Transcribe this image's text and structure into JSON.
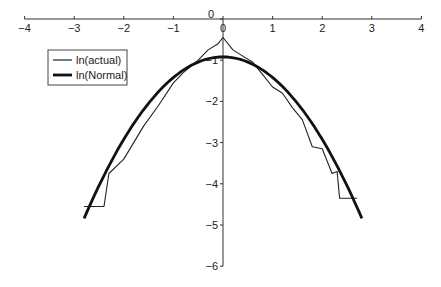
{
  "chart_data": {
    "type": "line",
    "title": "",
    "xlabel": "",
    "ylabel": "",
    "xlim": [
      -4,
      4
    ],
    "ylim": [
      -6,
      0
    ],
    "grid": false,
    "legend_position": "upper-left",
    "x_ticks": [
      -4,
      -3,
      -2,
      -1,
      0,
      1,
      2,
      3,
      4
    ],
    "x_tick_labels": [
      "−4",
      "−3",
      "−2",
      "−1",
      "0",
      "1",
      "2",
      "3",
      "4"
    ],
    "y_ticks": [
      0,
      -1,
      -2,
      -3,
      -4,
      -5,
      -6
    ],
    "y_tick_labels": [
      "0",
      "−1",
      "−2",
      "−3",
      "−4",
      "−5",
      "−6"
    ],
    "series": [
      {
        "name": "ln(actual)",
        "style": "thin",
        "color": "#222222",
        "x": [
          -2.8,
          -2.4,
          -2.3,
          -2.0,
          -1.8,
          -1.6,
          -1.3,
          -1.0,
          -0.8,
          -0.5,
          -0.3,
          -0.1,
          0.0,
          0.2,
          0.4,
          0.6,
          0.8,
          1.0,
          1.2,
          1.4,
          1.6,
          1.8,
          2.0,
          2.2,
          2.3,
          2.35,
          2.7
        ],
        "y": [
          -4.55,
          -4.55,
          -3.75,
          -3.4,
          -3.0,
          -2.6,
          -2.1,
          -1.55,
          -1.3,
          -1.0,
          -0.75,
          -0.6,
          -0.45,
          -0.75,
          -0.9,
          -1.05,
          -1.35,
          -1.65,
          -1.8,
          -2.15,
          -2.45,
          -3.1,
          -3.15,
          -3.75,
          -3.7,
          -4.35,
          -4.35
        ]
      },
      {
        "name": "ln(Normal)",
        "style": "thick",
        "color": "#111111",
        "x": [
          -2.8,
          -2.4,
          -2.0,
          -1.6,
          -1.2,
          -0.8,
          -0.4,
          0.0,
          0.4,
          0.8,
          1.2,
          1.6,
          2.0,
          2.4,
          2.8
        ],
        "y": [
          -4.84,
          -3.8,
          -2.92,
          -2.2,
          -1.64,
          -1.24,
          -1.0,
          -0.92,
          -1.0,
          -1.24,
          -1.64,
          -2.2,
          -2.92,
          -3.8,
          -4.84
        ]
      }
    ]
  },
  "legend": {
    "items": [
      {
        "label": "ln(actual)"
      },
      {
        "label": "ln(Normal)"
      }
    ]
  }
}
